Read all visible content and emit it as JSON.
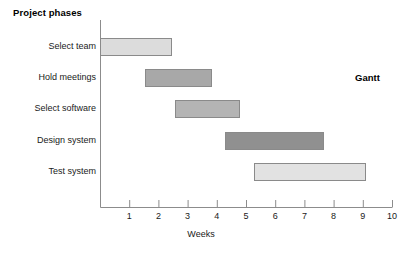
{
  "chart_data": {
    "type": "bar",
    "orientation": "horizontal",
    "subtype": "gantt",
    "title": "",
    "ylabel": "Project phases",
    "xlabel": "Weeks",
    "corner_label": "Gantt",
    "categories": [
      "Select team",
      "Hold meetings",
      "Select software",
      "Design system",
      "Test system"
    ],
    "xlim": [
      0,
      10.2
    ],
    "xticks": [
      1,
      2,
      3,
      4,
      5,
      6,
      7,
      8,
      9,
      10
    ],
    "xtick_labels": [
      "1",
      "2",
      "3",
      "4",
      "5",
      "6",
      "7",
      "8",
      "9",
      "10"
    ],
    "grid": false,
    "legend": "none",
    "tasks": [
      {
        "name": "Select team",
        "start": 0.0,
        "end": 2.45,
        "duration": 2.45,
        "color": "#dcdcdc"
      },
      {
        "name": "Hold meetings",
        "start": 1.55,
        "end": 3.85,
        "duration": 2.3,
        "color": "#a8a8a8"
      },
      {
        "name": "Select software",
        "start": 2.58,
        "end": 4.78,
        "duration": 2.2,
        "color": "#b4b4b4"
      },
      {
        "name": "Design system",
        "start": 4.28,
        "end": 7.68,
        "duration": 3.4,
        "color": "#909090"
      },
      {
        "name": "Test system",
        "start": 5.28,
        "end": 9.1,
        "duration": 3.82,
        "color": "#e2e2e2"
      }
    ]
  },
  "style": {
    "axis_color": "#8c8c8c",
    "bar_border": "#8a8a8a",
    "text_color": "#1a1a1a",
    "background": "#ffffff"
  }
}
